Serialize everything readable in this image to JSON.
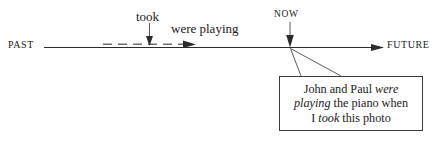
{
  "figure": {
    "type": "timeline-diagram",
    "topic": "past progressive tense timeline"
  },
  "timeline": {
    "past_label": "PAST",
    "future_label": "FUTURE",
    "now_label": "NOW",
    "line_color": "#2b2b2b"
  },
  "events": {
    "took_label": "took",
    "were_playing_label": "were playing"
  },
  "callout": {
    "line1_a": "John and Paul ",
    "line1_b": "were",
    "line2_a": "playing",
    "line2_b": " the piano when",
    "line3_a": "I ",
    "line3_b": "took",
    "line3_c": " this photo",
    "full_text": "John and Paul were playing the piano when I took this photo",
    "border_color": "#3a3a3a"
  }
}
